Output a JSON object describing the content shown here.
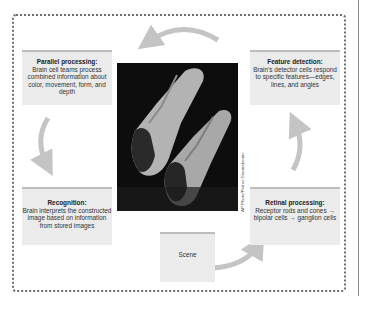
{
  "diagram": {
    "type": "cycle",
    "nodes": [
      {
        "id": "parallel",
        "title": "Parallel processing:",
        "body": "Brain cell teams process combined information about color, movement, form, and depth"
      },
      {
        "id": "feature",
        "title": "Feature detection:",
        "body": "Brain’s detector cells respond to specific features—edges, lines, and angles"
      },
      {
        "id": "retinal",
        "title": "Retinal processing:",
        "body": "Receptor rods and cones → bipolar cells → ganglion cells"
      },
      {
        "id": "recognition",
        "title": "Recognition:",
        "body": "Brain interprets the constructed image based on information from stored images"
      },
      {
        "id": "scene",
        "title": "",
        "body": "Scene"
      }
    ],
    "flow": [
      "scene",
      "retinal",
      "feature",
      "parallel",
      "recognition"
    ],
    "photo_credit": "AP Photo/Petros Giannakouris",
    "photo_subject": "two synchronized divers in mid-air"
  },
  "colors": {
    "box_fill": "#ebebeb",
    "box_top_border": "#bdbdbd",
    "arrow": "#c4c4c4",
    "frame": "#6e6e6e"
  }
}
